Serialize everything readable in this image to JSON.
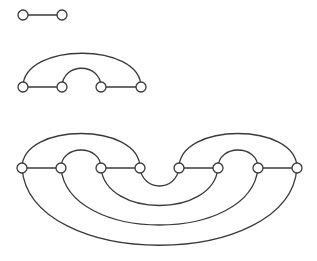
{
  "diagram": {
    "colors": {
      "stroke": "#3a3a3a",
      "node_fill": "#ffffff",
      "background": "#ffffff"
    },
    "node_radius": 5,
    "graphs": [
      {
        "name": "graph-1",
        "nodes": [
          [
            23,
            15
          ],
          [
            62,
            15
          ]
        ],
        "edges": [
          {
            "type": "line",
            "d": "M23 15 L62 15"
          }
        ]
      },
      {
        "name": "graph-2",
        "nodes": [
          [
            23,
            87
          ],
          [
            62,
            87
          ],
          [
            101,
            87
          ],
          [
            141,
            87
          ]
        ],
        "edges": [
          {
            "type": "line",
            "d": "M23 87 L62 87"
          },
          {
            "type": "line",
            "d": "M101 87 L141 87"
          },
          {
            "type": "arc",
            "d": "M62 87 C62 62 101 62 101 87"
          },
          {
            "type": "arc",
            "d": "M23 87 C23 42 141 42 141 87"
          }
        ]
      },
      {
        "name": "graph-3",
        "nodes": [
          [
            22,
            168
          ],
          [
            61,
            168
          ],
          [
            101,
            168
          ],
          [
            140,
            168
          ],
          [
            179,
            168
          ],
          [
            218,
            168
          ],
          [
            258,
            168
          ],
          [
            297,
            168
          ]
        ],
        "edges": [
          {
            "type": "line",
            "d": "M22 168 L61 168"
          },
          {
            "type": "line",
            "d": "M101 168 L140 168"
          },
          {
            "type": "line",
            "d": "M179 168 L218 168"
          },
          {
            "type": "line",
            "d": "M258 168 L297 168"
          },
          {
            "type": "arc",
            "d": "M61 168 C61 144 101 144 101 168"
          },
          {
            "type": "arc",
            "d": "M22 168 C22 122 140 122 140 168"
          },
          {
            "type": "arc",
            "d": "M218 168 C218 144 258 144 258 168"
          },
          {
            "type": "arc",
            "d": "M179 168 C179 122 297 122 297 168"
          },
          {
            "type": "arc",
            "d": "M140 168 C143 192 176 192 179 168"
          },
          {
            "type": "arc",
            "d": "M101 168 C106 218 213 218 218 168"
          },
          {
            "type": "arc",
            "d": "M61 168 C68 244 251 244 258 168"
          },
          {
            "type": "arc",
            "d": "M22 168 C30 271 289 271 297 168"
          }
        ]
      }
    ]
  }
}
